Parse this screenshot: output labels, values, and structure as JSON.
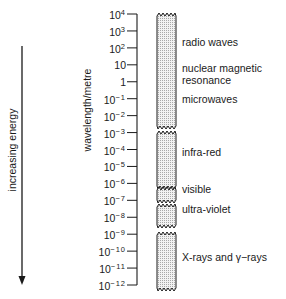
{
  "diagram": {
    "energy_arrow_label": "increasing energy",
    "axis_label": "wavelength/metre",
    "ticks": [
      {
        "base": "10",
        "exp": "4"
      },
      {
        "base": "10",
        "exp": "3"
      },
      {
        "base": "10",
        "exp": "2"
      },
      {
        "base": "10",
        "exp": ""
      },
      {
        "base": "1",
        "exp": ""
      },
      {
        "base": "10",
        "exp": "−1"
      },
      {
        "base": "10",
        "exp": "−2"
      },
      {
        "base": "10",
        "exp": "−3"
      },
      {
        "base": "10",
        "exp": "−4"
      },
      {
        "base": "10",
        "exp": "−5"
      },
      {
        "base": "10",
        "exp": "−6"
      },
      {
        "base": "10",
        "exp": "−7"
      },
      {
        "base": "10",
        "exp": "−8"
      },
      {
        "base": "10",
        "exp": "−9"
      },
      {
        "base": "10",
        "exp": "−10"
      },
      {
        "base": "10",
        "exp": "−11"
      },
      {
        "base": "10",
        "exp": "−12"
      }
    ],
    "bands": [
      {
        "label": "radio waves",
        "label_y": 42
      },
      {
        "label": "nuclear magnetic",
        "label_y": 68
      },
      {
        "label": "resonance",
        "label_y": 80
      },
      {
        "label": "microwaves",
        "label_y": 99
      },
      {
        "label": "infra-red",
        "label_y": 152
      },
      {
        "label": "visible",
        "label_y": 189
      },
      {
        "label": "ultra-violet",
        "label_y": 209
      },
      {
        "label": "X-rays and γ−rays",
        "label_y": 257
      }
    ],
    "colors": {
      "ink": "#1a1a1a",
      "fill": "#e4e4e4"
    }
  }
}
